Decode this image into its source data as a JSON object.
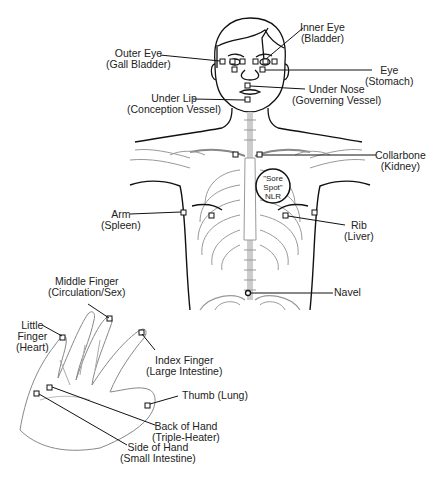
{
  "diagram": {
    "type": "acupressure-test-points",
    "colors": {
      "line": "#111111",
      "sketch": "#9a9a9a",
      "background": "#ffffff"
    },
    "points": [
      {
        "id": "inner-eye",
        "name": "Inner Eye",
        "organ": "(Bladder)"
      },
      {
        "id": "outer-eye",
        "name": "Outer Eye",
        "organ": "(Gall Bladder)"
      },
      {
        "id": "eye",
        "name": "Eye",
        "organ": "(Stomach)"
      },
      {
        "id": "under-nose",
        "name": "Under Nose",
        "organ": "(Governing Vessel)"
      },
      {
        "id": "under-lip",
        "name": "Under Lip",
        "organ": "(Conception Vessel)"
      },
      {
        "id": "collarbone",
        "name": "Collarbone",
        "organ": "(Kidney)"
      },
      {
        "id": "arm",
        "name": "Arm",
        "organ": "(Spleen)"
      },
      {
        "id": "rib",
        "name": "Rib",
        "organ": "(Liver)"
      },
      {
        "id": "navel",
        "name": "Navel",
        "organ": ""
      },
      {
        "id": "middle-finger",
        "name": "Middle Finger",
        "organ": "(Circulation/Sex)"
      },
      {
        "id": "little-finger",
        "name": "Little",
        "name2": "Finger",
        "organ": "(Heart)"
      },
      {
        "id": "index-finger",
        "name": "Index Finger",
        "organ": "(Large Intestine)"
      },
      {
        "id": "thumb",
        "name": "Thumb (Lung)",
        "organ": ""
      },
      {
        "id": "back-of-hand",
        "name": "Back of Hand",
        "organ": "(Triple-Heater)"
      },
      {
        "id": "side-of-hand",
        "name": "Side of Hand",
        "organ": "(Small Intestine)"
      }
    ],
    "sore_spot": {
      "line1": "\"Sore",
      "line2": "Spot\"",
      "line3": "NLR"
    }
  }
}
